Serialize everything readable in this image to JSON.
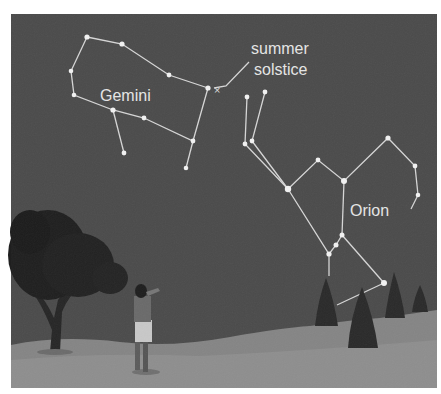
{
  "figure": {
    "labels": {
      "gemini": "Gemini",
      "orion": "Orion",
      "solstice_line1": "summer",
      "solstice_line2": "solstice"
    },
    "colors": {
      "sky": "#4b4b4b",
      "ground": "#8c8c8c",
      "star": "#f2f2f2",
      "line": "#d6d6d6",
      "text": "#e6e6e6",
      "tree": "#1e1e1e"
    },
    "constellations": [
      {
        "name": "Gemini",
        "stars": [
          [
            87,
            37
          ],
          [
            122,
            44
          ],
          [
            169,
            75
          ],
          [
            208,
            88
          ],
          [
            71,
            71
          ],
          [
            74,
            95
          ],
          [
            113,
            110
          ],
          [
            144,
            118
          ],
          [
            193,
            141
          ],
          [
            124,
            153
          ],
          [
            186,
            168
          ]
        ]
      },
      {
        "name": "Orion",
        "stars": [
          [
            247,
            97
          ],
          [
            265,
            92
          ],
          [
            245,
            144
          ],
          [
            252,
            141
          ],
          [
            288,
            189
          ],
          [
            318,
            160
          ],
          [
            344,
            181
          ],
          [
            388,
            138
          ],
          [
            415,
            166
          ],
          [
            418,
            195
          ],
          [
            342,
            235
          ],
          [
            336,
            245
          ],
          [
            329,
            254
          ],
          [
            384,
            283
          ]
        ]
      }
    ],
    "markers": {
      "summer_solstice_symbol": "×"
    }
  }
}
